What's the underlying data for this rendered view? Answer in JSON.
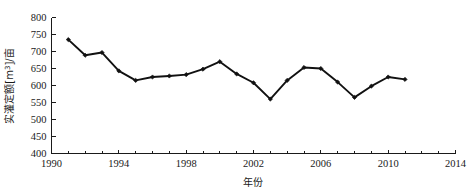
{
  "chart_data": {
    "type": "line",
    "title": "",
    "xlabel": "年份",
    "ylabel": "实灌定额[m³/亩]",
    "ylabel_parts": {
      "prefix": "实灌定额[m",
      "superscript": "3",
      "suffix": "]/亩"
    },
    "xlim": [
      1990,
      2014
    ],
    "ylim": [
      400,
      800
    ],
    "xticks": [
      1990,
      1994,
      1998,
      2002,
      2006,
      2010,
      2014
    ],
    "xtick_labels": [
      "1990",
      "1994",
      "1998",
      "2002",
      "2006",
      "2010",
      "2014"
    ],
    "yticks": [
      400,
      450,
      500,
      550,
      600,
      650,
      700,
      750,
      800
    ],
    "ytick_labels": [
      "400",
      "450",
      "500",
      "550",
      "600",
      "650",
      "700",
      "750",
      "800"
    ],
    "x_minor_tick_step": 1,
    "grid": false,
    "legend": false,
    "marker": "diamond",
    "line_color": "#111111",
    "marker_color": "#111111",
    "x": [
      1991,
      1992,
      1993,
      1994,
      1995,
      1996,
      1997,
      1998,
      1999,
      2000,
      2001,
      2002,
      2003,
      2004,
      2005,
      2006,
      2007,
      2008,
      2009,
      2010,
      2011
    ],
    "values": [
      735,
      689,
      697,
      643,
      615,
      625,
      628,
      632,
      648,
      670,
      634,
      608,
      560,
      615,
      653,
      650,
      610,
      565,
      598,
      625,
      618
    ],
    "series": [
      {
        "name": "实灌定额",
        "values": [
          735,
          689,
          697,
          643,
          615,
          625,
          628,
          632,
          648,
          670,
          634,
          608,
          560,
          615,
          653,
          650,
          610,
          565,
          598,
          625,
          618
        ]
      }
    ]
  },
  "axis_titles": {
    "x": "年份",
    "y_prefix": "实灌定额[m",
    "y_superscript": "3",
    "y_suffix": "]/亩"
  }
}
